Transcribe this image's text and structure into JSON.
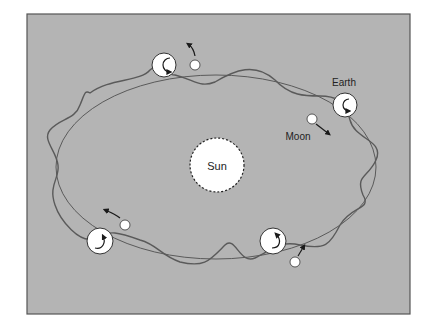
{
  "diagram": {
    "title": "",
    "labels": {
      "sun": "Sun",
      "earth": "Earth",
      "moon": "Moon"
    },
    "colors": {
      "background": "#b4b4b4",
      "frame": "#555555",
      "orbit": "#5a5a5a",
      "body_fill": "#ffffff",
      "arrow": "#1a1a1a"
    },
    "earth_positions": [
      {
        "id": "top",
        "x": 164,
        "y": 65
      },
      {
        "id": "right",
        "x": 345,
        "y": 105
      },
      {
        "id": "bottom-left",
        "x": 100,
        "y": 241
      },
      {
        "id": "bottom-right",
        "x": 273,
        "y": 241
      }
    ],
    "moon_positions": [
      {
        "id": "top",
        "x": 195,
        "y": 65
      },
      {
        "id": "right",
        "x": 312,
        "y": 119
      },
      {
        "id": "bottom-left",
        "x": 125,
        "y": 225
      },
      {
        "id": "bottom-right",
        "x": 295,
        "y": 262
      }
    ]
  }
}
